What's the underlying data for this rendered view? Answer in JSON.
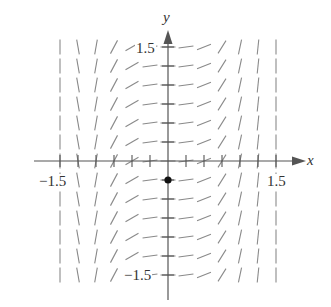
{
  "diagram": {
    "type": "slope_field",
    "axes": {
      "x_label": "x",
      "y_label": "y",
      "x_tick_labels": [
        {
          "value": -1.5,
          "text": "−1.5"
        },
        {
          "value": 1.5,
          "text": "1.5"
        }
      ],
      "y_tick_labels": [
        {
          "value": 1.5,
          "text": "1.5"
        },
        {
          "value": -1.5,
          "text": "−1.5"
        }
      ],
      "x_range": [
        -1.5,
        1.5
      ],
      "y_range": [
        -1.5,
        1.5
      ],
      "tick_step": 0.25
    },
    "grid": {
      "x_values": [
        -1.5,
        -1.25,
        -1.0,
        -0.75,
        -0.5,
        -0.25,
        0,
        0.25,
        0.5,
        0.75,
        1.0,
        1.25,
        1.5
      ],
      "y_values": [
        1.5,
        1.25,
        1.0,
        0.75,
        0.5,
        0.25,
        0,
        -0.25,
        -0.5,
        -0.75,
        -1.0,
        -1.25,
        -1.5
      ],
      "column_angles_deg": [
        90,
        100,
        80,
        62,
        30,
        8,
        0,
        8,
        22,
        58,
        78,
        84,
        90
      ]
    },
    "initial_point": {
      "x": 0,
      "y": -0.25
    },
    "colors": {
      "segment": "#8a8a8a",
      "axis": "#555555",
      "point": "#111111",
      "text": "#333333"
    }
  }
}
